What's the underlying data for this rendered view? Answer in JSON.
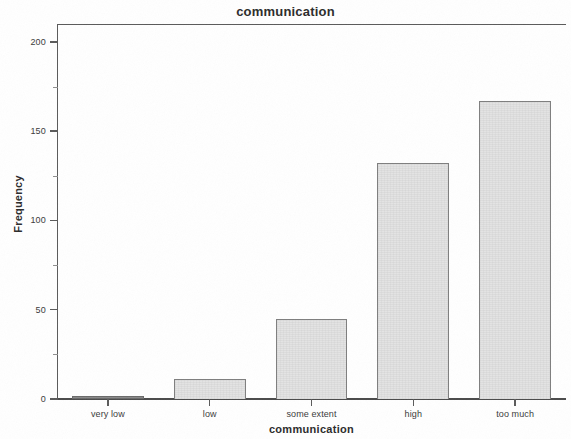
{
  "chart_data": {
    "type": "bar",
    "title": "communication",
    "xlabel": "communication",
    "ylabel": "Frequency",
    "categories": [
      "very low",
      "low",
      "some extent",
      "high",
      "too much"
    ],
    "values": [
      1,
      11,
      45,
      132,
      167
    ],
    "ylim": [
      0,
      210
    ],
    "yticks": [
      0,
      50,
      100,
      150,
      200
    ],
    "ytick_labels": [
      "0",
      "50",
      "100",
      "150",
      "200"
    ],
    "grid": false,
    "legend": null,
    "colors": {
      "bar_fill": "#e4e4e4",
      "bar_border": "#7e7e7e",
      "axis": "#5a5a5a",
      "text": "#2b2b2b",
      "background": "#ffffff"
    }
  }
}
